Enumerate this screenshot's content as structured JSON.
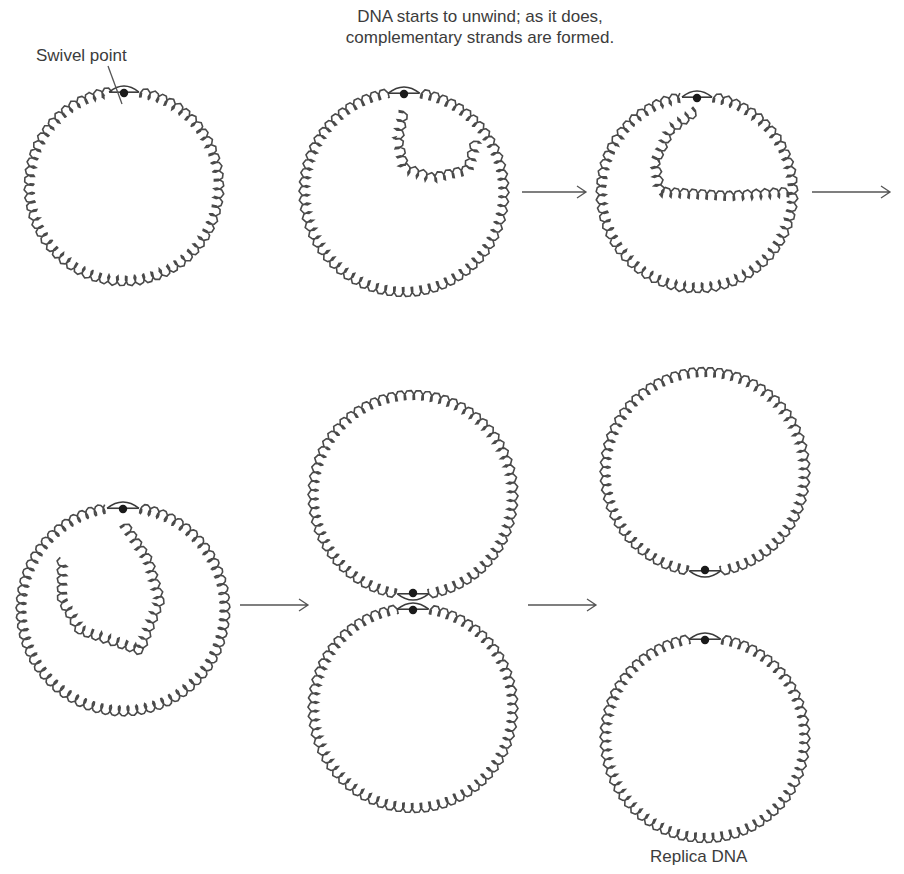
{
  "labels": {
    "swivel_point": "Swivel point",
    "unwind_line1": "DNA starts to unwind; as it does,",
    "unwind_line2": "complementary strands are formed.",
    "replica": "Replica DNA"
  },
  "colors": {
    "ink": "#4a4a4a",
    "dot": "#1a1a1a",
    "background": "#ffffff"
  },
  "stages": [
    {
      "id": 1,
      "desc": "Circular DNA with swivel point"
    },
    {
      "id": 2,
      "desc": "Unwinding begins, small replicated loop"
    },
    {
      "id": 3,
      "desc": "Replicated loop grows"
    },
    {
      "id": 4,
      "desc": "Replication nearly complete"
    },
    {
      "id": 5,
      "desc": "Two linked circles at swivel point"
    },
    {
      "id": 6,
      "desc": "Two separate replica DNA circles"
    }
  ]
}
